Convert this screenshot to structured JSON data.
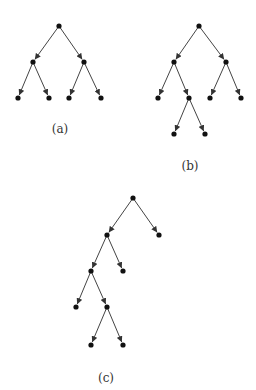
{
  "colors": {
    "edge": "#444444",
    "node": "#111111",
    "background": "#ffffff"
  },
  "figures": [
    {
      "label": "(a)",
      "label_pos": [
        60,
        122
      ],
      "nodes": [
        [
          59,
          26
        ],
        [
          33,
          62
        ],
        [
          84,
          62
        ],
        [
          18,
          98
        ],
        [
          49,
          98
        ],
        [
          69,
          98
        ],
        [
          101,
          98
        ]
      ],
      "edges": [
        [
          0,
          1
        ],
        [
          0,
          2
        ],
        [
          1,
          3
        ],
        [
          1,
          4
        ],
        [
          2,
          5
        ],
        [
          2,
          6
        ]
      ]
    },
    {
      "label": "(b)",
      "label_pos": [
        190,
        159
      ],
      "nodes": [
        [
          199,
          26
        ],
        [
          174,
          62
        ],
        [
          226,
          62
        ],
        [
          158,
          98
        ],
        [
          189,
          98
        ],
        [
          210,
          98
        ],
        [
          241,
          98
        ],
        [
          174,
          134
        ],
        [
          205,
          134
        ]
      ],
      "edges": [
        [
          0,
          1
        ],
        [
          0,
          2
        ],
        [
          1,
          3
        ],
        [
          1,
          4
        ],
        [
          2,
          5
        ],
        [
          2,
          6
        ],
        [
          4,
          7
        ],
        [
          4,
          8
        ]
      ]
    },
    {
      "label": "(c)",
      "label_pos": [
        106,
        371
      ],
      "nodes": [
        [
          133,
          198
        ],
        [
          107,
          235
        ],
        [
          159,
          235
        ],
        [
          91,
          271
        ],
        [
          123,
          271
        ],
        [
          76,
          307
        ],
        [
          107,
          307
        ],
        [
          91,
          345
        ],
        [
          123,
          345
        ]
      ],
      "edges": [
        [
          0,
          1
        ],
        [
          0,
          2
        ],
        [
          1,
          3
        ],
        [
          1,
          4
        ],
        [
          3,
          5
        ],
        [
          3,
          6
        ],
        [
          6,
          7
        ],
        [
          6,
          8
        ]
      ]
    }
  ]
}
